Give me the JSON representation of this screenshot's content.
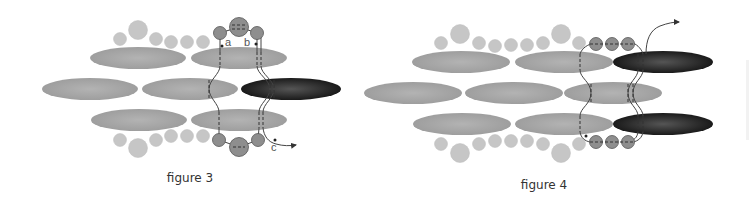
{
  "figures": [
    {
      "id": "figure-3",
      "caption": "figure 3",
      "labels": {
        "a": "a",
        "b": "b",
        "c": "c"
      },
      "description": "Three rows of long oval beads (one dark highlighted bead in middle row) with small round beads on top and bottom edges; thread path loops through round bead clusters"
    },
    {
      "id": "figure-4",
      "caption": "figure 4",
      "description": "Three rows of long oval beads with two dark highlighted beads on top and bottom rows; three-bead clusters on top and bottom, thread exits upward with arrow"
    }
  ],
  "colors": {
    "oval_light": "#a9a9a9",
    "oval_dark": "#2e2e2e",
    "round_small": "#c8c8c8",
    "round_cluster": "#8c8c8c",
    "thread": "#444444"
  }
}
